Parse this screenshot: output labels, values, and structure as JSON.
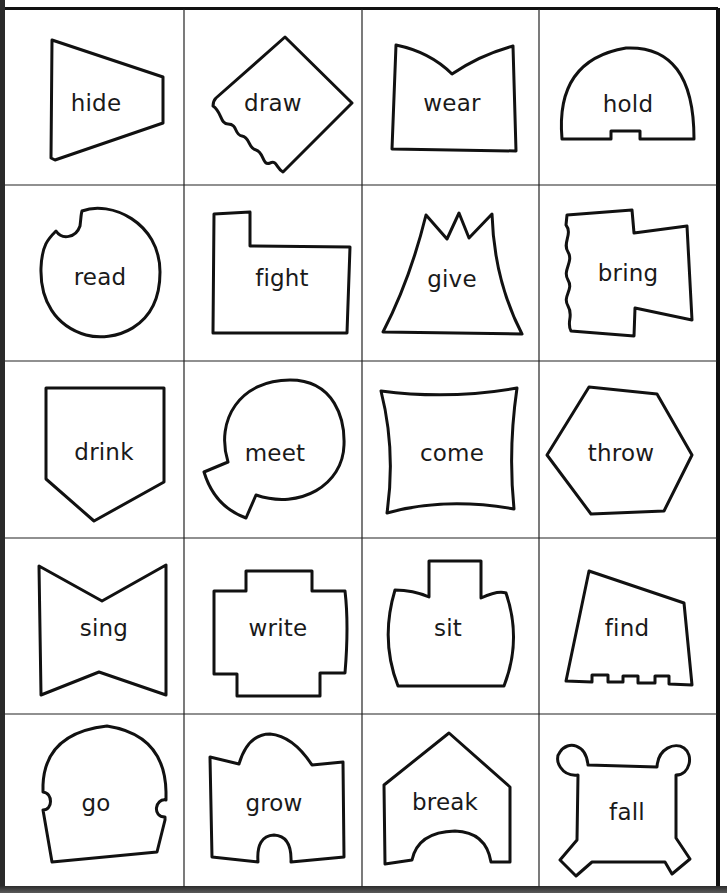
{
  "worksheet": {
    "title": "Verb shape cards",
    "grid": {
      "rows": 5,
      "cols": 4
    },
    "colors": {
      "ink": "#111111",
      "paper": "#ffffff",
      "grid": "#222222"
    },
    "cards": [
      {
        "word": "hide",
        "shape": "trapezoid"
      },
      {
        "word": "draw",
        "shape": "diamond-torn-edge"
      },
      {
        "word": "wear",
        "shape": "notched-top-quad"
      },
      {
        "word": "hold",
        "shape": "semicircle-notched"
      },
      {
        "word": "read",
        "shape": "circle-bitten"
      },
      {
        "word": "fight",
        "shape": "folder"
      },
      {
        "word": "give",
        "shape": "volcano"
      },
      {
        "word": "bring",
        "shape": "flag-wavy-edge"
      },
      {
        "word": "drink",
        "shape": "pentagon-pointed-bottom"
      },
      {
        "word": "meet",
        "shape": "circle-wedge-cut"
      },
      {
        "word": "come",
        "shape": "concave-square"
      },
      {
        "word": "throw",
        "shape": "hexagon"
      },
      {
        "word": "sing",
        "shape": "bowtie"
      },
      {
        "word": "write",
        "shape": "stepped-cross"
      },
      {
        "word": "sit",
        "shape": "boat"
      },
      {
        "word": "find",
        "shape": "quad-crenellated-bottom"
      },
      {
        "word": "go",
        "shape": "dome-side-notches"
      },
      {
        "word": "grow",
        "shape": "puzzle-piece"
      },
      {
        "word": "break",
        "shape": "house-arch"
      },
      {
        "word": "fall",
        "shape": "square-knobbed-corners"
      }
    ]
  }
}
